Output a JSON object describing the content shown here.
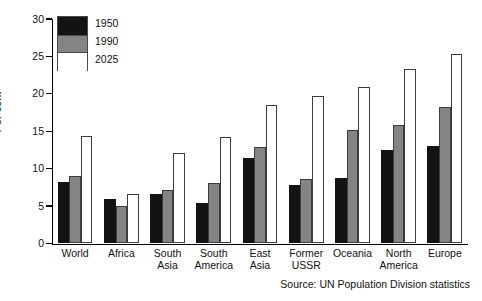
{
  "chart_data": {
    "type": "bar",
    "title": "",
    "subtitle": "",
    "xlabel": "",
    "ylabel": "Per cent",
    "ylim": [
      0,
      30
    ],
    "yticks": [
      0,
      5,
      10,
      15,
      20,
      25,
      30
    ],
    "ytick_labels": [
      "0",
      "5",
      "10",
      "15",
      "20",
      "25",
      "30"
    ],
    "grid": false,
    "legend_position": "top-left",
    "categories": [
      "World",
      "Africa",
      "South\nAsia",
      "South\nAmerica",
      "East\nAsia",
      "Former\nUSSR",
      "Oceania",
      "North\nAmerica",
      "Europe"
    ],
    "series": [
      {
        "name": "1950",
        "color": "#131313",
        "values": [
          8.1,
          5.9,
          6.6,
          5.4,
          11.4,
          7.7,
          8.7,
          12.4,
          13.0
        ]
      },
      {
        "name": "1990",
        "color": "#848484",
        "values": [
          8.9,
          4.9,
          7.1,
          8.0,
          12.8,
          8.6,
          15.1,
          15.8,
          18.2
        ]
      },
      {
        "name": "2025",
        "color": "#ffffff",
        "values": [
          14.3,
          6.5,
          12.0,
          14.2,
          18.5,
          19.6,
          20.9,
          23.2,
          25.2
        ]
      }
    ],
    "annotations": [
      "Source: UN Population Division statistics"
    ]
  },
  "legend": {
    "items": [
      "1950",
      "1990",
      "2025"
    ]
  },
  "source_note": "Source: UN Population Division statistics"
}
